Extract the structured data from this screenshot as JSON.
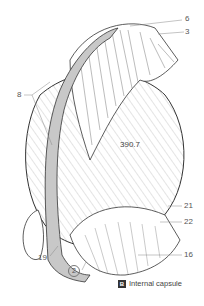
{
  "figure": {
    "center_value": "390.7",
    "labels": [
      {
        "id": "6",
        "text": "6"
      },
      {
        "id": "3",
        "text": "3"
      },
      {
        "id": "8",
        "text": "8"
      },
      {
        "id": "21",
        "text": "21"
      },
      {
        "id": "22",
        "text": "22"
      },
      {
        "id": "16",
        "text": "16"
      },
      {
        "id": "19",
        "text": "19"
      },
      {
        "id": "2",
        "text": "2"
      }
    ],
    "caption": {
      "badge": "B",
      "text": "Internal capsule"
    },
    "colors": {
      "fiber_band": "#c8c8c8",
      "outline": "#333333",
      "hatch": "#e6e6e6",
      "badge_bg": "#333333"
    }
  }
}
